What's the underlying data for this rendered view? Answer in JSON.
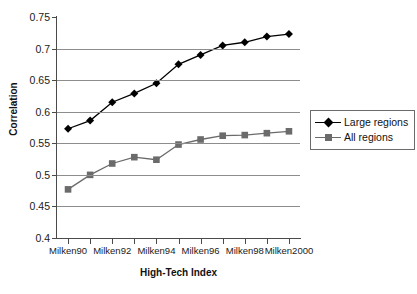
{
  "chart_data": {
    "type": "line",
    "title": "",
    "xlabel": "High-Tech Index",
    "ylabel": "Correlation",
    "ylim": [
      0.4,
      0.75
    ],
    "ytick_labels": [
      "0.75",
      "0.7",
      "0.65",
      "0.6",
      "0.55",
      "0.5",
      "0.45",
      "0.4"
    ],
    "ytick_values": [
      0.75,
      0.7,
      0.65,
      0.6,
      0.55,
      0.5,
      0.45,
      0.4
    ],
    "grid": "horizontal",
    "legend_position": "right",
    "categories": [
      "Milken90",
      "Milken91",
      "Milken92",
      "Milken93",
      "Milken94",
      "Milken95",
      "Milken96",
      "Milken97",
      "Milken98",
      "Milken99",
      "Milken2000"
    ],
    "xtick_labels_shown": [
      "Milken90",
      "",
      "Milken92",
      "",
      "Milken94",
      "",
      "Milken96",
      "",
      "Milken98",
      "",
      "Milken2000"
    ],
    "series": [
      {
        "name": "Large regions",
        "marker": "diamond",
        "color": "#000000",
        "values": [
          0.573,
          0.586,
          0.615,
          0.629,
          0.645,
          0.675,
          0.69,
          0.705,
          0.71,
          0.719,
          0.723
        ]
      },
      {
        "name": "All regions",
        "marker": "square",
        "color": "#6b6b6b",
        "values": [
          0.477,
          0.5,
          0.518,
          0.528,
          0.524,
          0.548,
          0.556,
          0.562,
          0.563,
          0.566,
          0.569
        ]
      }
    ]
  },
  "legend": {
    "items": [
      {
        "label": "Large regions"
      },
      {
        "label": "All regions"
      }
    ]
  }
}
